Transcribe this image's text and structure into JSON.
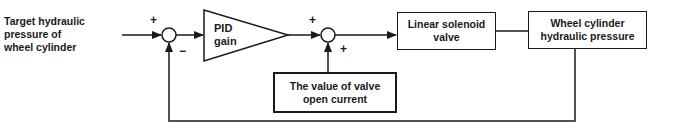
{
  "diagram": {
    "type": "control-loop-block-diagram",
    "input_label": "Target hydraulic\npressure of\nwheel cylinder",
    "blocks": {
      "pid": "PID\ngain",
      "solenoid": "Linear solenoid\nvalve",
      "wheel": "Wheel cylinder\nhydraulic pressure",
      "open_current": "The value of  valve\nopen current"
    },
    "signs": {
      "sum1_input": "+",
      "sum1_feedback": "−",
      "sum2_input": "+",
      "sum2_bias": "+"
    },
    "connections": [
      {
        "from": "input",
        "to": "sum1",
        "sign": "+"
      },
      {
        "from": "sum1",
        "to": "pid"
      },
      {
        "from": "pid",
        "to": "sum2",
        "sign": "+"
      },
      {
        "from": "open_current",
        "to": "sum2",
        "sign": "+"
      },
      {
        "from": "sum2",
        "to": "solenoid"
      },
      {
        "from": "solenoid",
        "to": "wheel"
      },
      {
        "from": "wheel",
        "to": "sum1",
        "sign": "−",
        "kind": "feedback"
      }
    ],
    "colors": {
      "ink": "#1a1a1a",
      "background": "#ffffff"
    }
  }
}
